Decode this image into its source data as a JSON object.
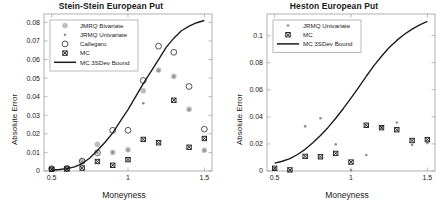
{
  "figure": {
    "width": 445,
    "height": 214,
    "background": "#ffffff"
  },
  "panels": [
    {
      "id": "stein-stein",
      "title": "Stein-Stein European Put",
      "xlabel": "Moneyness",
      "ylabel": "Absolute Error",
      "xticks": [
        0.5,
        1,
        1.5
      ],
      "xticklabels": [
        "0.5",
        "1",
        "1.5"
      ],
      "yticks": [
        0,
        0.01,
        0.02,
        0.03,
        0.04,
        0.05,
        0.06,
        0.07,
        0.08
      ],
      "yticklabels": [
        "0",
        "0.01",
        "0.02",
        "0.03",
        "0.04",
        "0.05",
        "0.06",
        "0.07",
        "0.08"
      ],
      "xlim": [
        0.45,
        1.55
      ],
      "ylim": [
        0,
        0.0845
      ],
      "legend_position": "upper-left",
      "legend": [
        {
          "label": "JMRQ Bivariate",
          "marker": "circle-filled",
          "color": "#bdbdbd"
        },
        {
          "label": "JRMQ Univariate",
          "marker": "dot-small",
          "color": "#8c8c8c"
        },
        {
          "label": "Callegaro",
          "marker": "circle-open",
          "color": "#3c3c3c"
        },
        {
          "label": "MC",
          "marker": "cross-square",
          "color": "#1a1a1a"
        },
        {
          "label": "MC 3SDev Bound",
          "marker": "line",
          "color": "#1a1a1a"
        }
      ],
      "chart_data": {
        "type": "scatter",
        "title": "Stein-Stein European Put",
        "xlabel": "Moneyness",
        "ylabel": "Absolute Error",
        "xlim": [
          0.45,
          1.55
        ],
        "ylim": [
          0,
          0.0845
        ],
        "grid": false,
        "legend_position": "upper left",
        "x": [
          0.5,
          0.6,
          0.7,
          0.8,
          0.9,
          1.0,
          1.1,
          1.2,
          1.3,
          1.4,
          1.5
        ],
        "series": [
          {
            "name": "JMRQ Bivariate",
            "marker": "circle-filled",
            "color": "#bdbdbd",
            "values": [
              0.0012,
              0.0013,
              0.0052,
              0.0143,
              0.01,
              0.0115,
              0.0432,
              0.0543,
              0.051,
              0.0333,
              0.0112
            ]
          },
          {
            "name": "JRMQ Univariate",
            "marker": "dot-small",
            "color": "#8c8c8c",
            "values": [
              0.001,
              0.0012,
              0.0048,
              0.0098,
              0.01,
              0.0112,
              0.0365,
              0.054,
              0.0508,
              0.033,
              0.011
            ]
          },
          {
            "name": "Callegaro",
            "marker": "circle-open",
            "color": "#3c3c3c",
            "values": [
              0.0012,
              0.0014,
              0.0053,
              0.0098,
              0.0219,
              0.0219,
              0.0487,
              0.0672,
              0.0639,
              0.0455,
              0.0225
            ]
          },
          {
            "name": "MC",
            "marker": "cross-square",
            "color": "#1a1a1a",
            "values": [
              0.0009,
              0.0011,
              0.0016,
              0.0051,
              0.0031,
              0.0061,
              0.017,
              0.0152,
              0.0381,
              0.0128,
              0.0175
            ]
          }
        ],
        "bound": {
          "name": "MC 3SDev Bound",
          "type": "line",
          "color": "#1a1a1a",
          "x": [
            0.5,
            0.55,
            0.6,
            0.65,
            0.7,
            0.75,
            0.8,
            0.85,
            0.9,
            0.95,
            1.0,
            1.05,
            1.1,
            1.15,
            1.2,
            1.25,
            1.3,
            1.35,
            1.4,
            1.45,
            1.5
          ],
          "values": [
            0.0004,
            0.0008,
            0.0013,
            0.0022,
            0.004,
            0.007,
            0.011,
            0.0155,
            0.0205,
            0.0268,
            0.033,
            0.04,
            0.047,
            0.0535,
            0.06,
            0.0665,
            0.0715,
            0.0755,
            0.078,
            0.0798,
            0.081
          ]
        }
      }
    },
    {
      "id": "heston",
      "title": "Heston European Put",
      "xlabel": "Moneyness",
      "ylabel": "Absolute Error",
      "xticks": [
        0.5,
        1,
        1.5
      ],
      "xticklabels": [
        "0.5",
        "1",
        "1.5"
      ],
      "yticks": [
        0,
        0.02,
        0.04,
        0.06,
        0.08,
        0.1
      ],
      "yticklabels": [
        "0",
        "0.02",
        "0.04",
        "0.06",
        "0.08",
        "0.1"
      ],
      "xlim": [
        0.45,
        1.55
      ],
      "ylim": [
        0,
        0.116
      ],
      "legend_position": "upper-left",
      "legend": [
        {
          "label": "JRMQ Univariate",
          "marker": "dot-small",
          "color": "#8c8c8c"
        },
        {
          "label": "MC",
          "marker": "cross-square",
          "color": "#1a1a1a"
        },
        {
          "label": "MC 3SDev Bound",
          "marker": "line",
          "color": "#1a1a1a"
        }
      ],
      "chart_data": {
        "type": "scatter",
        "title": "Heston European Put",
        "xlabel": "Moneyness",
        "ylabel": "Absolute Error",
        "xlim": [
          0.45,
          1.55
        ],
        "ylim": [
          0,
          0.116
        ],
        "grid": false,
        "legend_position": "upper left",
        "x": [
          0.5,
          0.6,
          0.7,
          0.8,
          0.9,
          1.0,
          1.1,
          1.2,
          1.3,
          1.4,
          1.5
        ],
        "series": [
          {
            "name": "JRMQ Univariate",
            "marker": "dot-small",
            "color": "#8c8c8c",
            "values": [
              0.0018,
              0.0006,
              0.033,
              0.039,
              0.0198,
              0.0006,
              0.0118,
              0.0322,
              0.0358,
              0.0192,
              0.0206
            ]
          },
          {
            "name": "MC",
            "marker": "cross-square",
            "color": "#1a1a1a",
            "values": [
              0.002,
              0.0008,
              0.0108,
              0.0105,
              0.013,
              0.0066,
              0.0338,
              0.032,
              0.0305,
              0.0225,
              0.0232
            ]
          }
        ],
        "bound": {
          "name": "MC 3SDev Bound",
          "type": "line",
          "color": "#1a1a1a",
          "x": [
            0.5,
            0.55,
            0.6,
            0.65,
            0.7,
            0.75,
            0.8,
            0.85,
            0.9,
            0.95,
            1.0,
            1.05,
            1.1,
            1.15,
            1.2,
            1.25,
            1.3,
            1.35,
            1.4,
            1.45,
            1.5
          ],
          "values": [
            0.0058,
            0.0072,
            0.0092,
            0.0122,
            0.016,
            0.0208,
            0.0262,
            0.0322,
            0.039,
            0.0462,
            0.0538,
            0.0618,
            0.07,
            0.0778,
            0.0848,
            0.0912,
            0.0965,
            0.101,
            0.1048,
            0.108,
            0.1105
          ]
        }
      }
    }
  ]
}
